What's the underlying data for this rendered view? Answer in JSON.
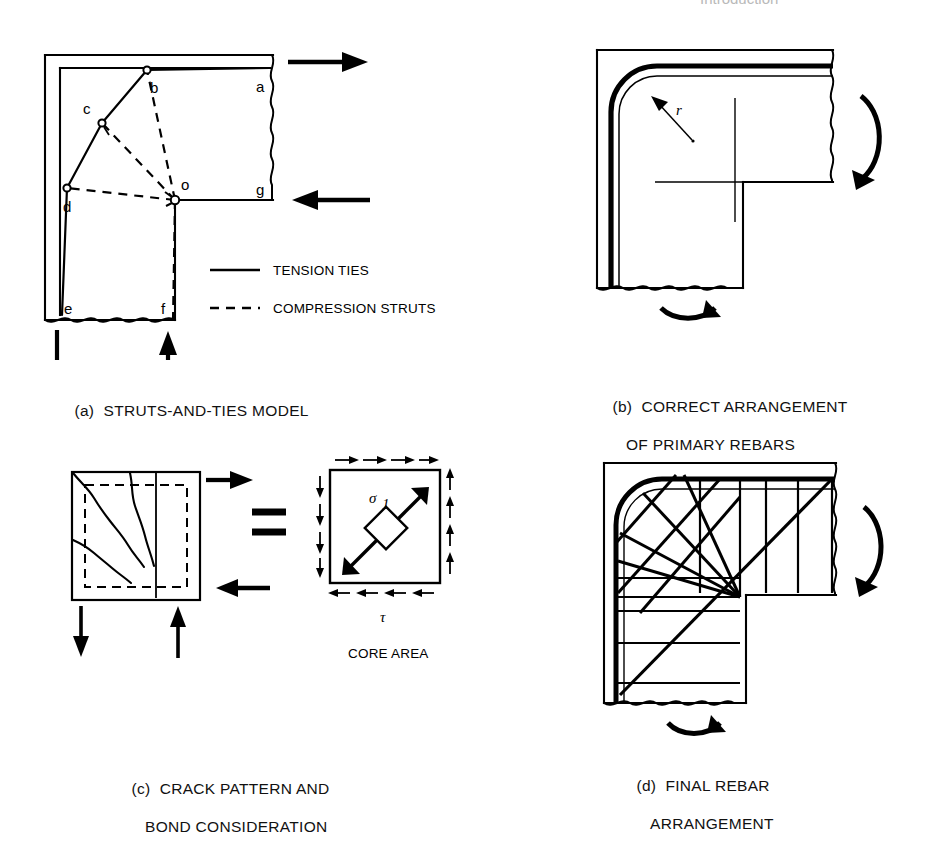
{
  "page": {
    "faded_header": "Introduction",
    "background_color": "#ffffff",
    "ink_color": "#000000"
  },
  "panels": [
    {
      "id": "a",
      "tag": "(a)",
      "caption_line1": "STRUTS-AND-TIES MODEL",
      "caption_line2": "",
      "nodes": [
        {
          "label": "a",
          "x": 232,
          "y": 76
        },
        {
          "label": "b",
          "x": 125,
          "y": 71
        },
        {
          "label": "c",
          "x": 73,
          "y": 92
        },
        {
          "label": "d",
          "x": 62,
          "y": 154
        },
        {
          "label": "e",
          "x": 63,
          "y": 280
        },
        {
          "label": "f",
          "x": 152,
          "y": 281
        },
        {
          "label": "g",
          "x": 232,
          "y": 155
        },
        {
          "label": "o",
          "x": 158,
          "y": 155
        }
      ],
      "legend": [
        {
          "style": "solid",
          "label": "TENSION TIES"
        },
        {
          "style": "dashed",
          "label": "COMPRESSION STRUTS"
        }
      ],
      "forces": [
        {
          "name": "top-tension-arrow",
          "direction": "right"
        },
        {
          "name": "mid-compression-arrow",
          "direction": "left"
        },
        {
          "name": "bottom-left-arrow",
          "direction": "down"
        },
        {
          "name": "bottom-mid-arrow",
          "direction": "up"
        }
      ]
    },
    {
      "id": "b",
      "tag": "(b)",
      "caption_line1": "CORRECT ARRANGEMENT",
      "caption_line2": "OF PRIMARY REBARS",
      "annotations": [
        {
          "label": "r",
          "meaning": "bend-radius"
        }
      ],
      "moments": [
        {
          "name": "right-moment-arc",
          "sense": "clockwise"
        },
        {
          "name": "bottom-moment-arc",
          "sense": "clockwise"
        }
      ]
    },
    {
      "id": "c",
      "tag": "(c)",
      "caption_line1": "CRACK PATTERN AND",
      "caption_line2": "BOND CONSIDERATION",
      "equals_symbol": "=",
      "core_area_label": "CORE AREA",
      "stress_labels": [
        {
          "symbol": "σ",
          "sub": "1",
          "meaning": "principal-tensile-stress"
        },
        {
          "symbol": "τ",
          "sub": "",
          "meaning": "shear-stress"
        }
      ],
      "forces": [
        {
          "name": "right-tension-arrow",
          "direction": "right"
        },
        {
          "name": "right-compression-arrow",
          "direction": "left"
        },
        {
          "name": "bottom-left-arrow",
          "direction": "down"
        },
        {
          "name": "bottom-mid-arrow",
          "direction": "up"
        }
      ]
    },
    {
      "id": "d",
      "tag": "(d)",
      "caption_line1": "FINAL REBAR",
      "caption_line2": "ARRANGEMENT",
      "moments": [
        {
          "name": "right-moment-arc",
          "sense": "clockwise"
        },
        {
          "name": "bottom-moment-arc",
          "sense": "clockwise"
        }
      ]
    }
  ]
}
